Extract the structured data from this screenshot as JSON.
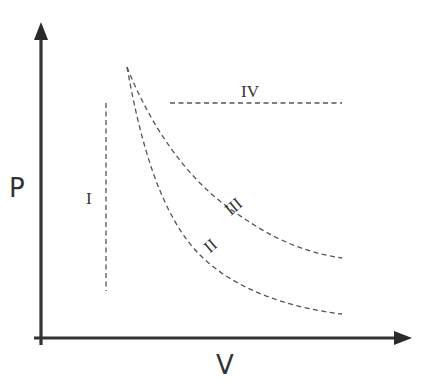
{
  "diagram": {
    "type": "pressure-volume process diagram",
    "axes": {
      "y_label": "P",
      "x_label": "V"
    },
    "processes": [
      {
        "id": "I",
        "label": "I",
        "shape": "vertical dashed line (constant volume)"
      },
      {
        "id": "II",
        "label": "II",
        "shape": "steeper descending dashed curve"
      },
      {
        "id": "III",
        "label": "III",
        "shape": "gentler descending dashed curve"
      },
      {
        "id": "IV",
        "label": "IV",
        "shape": "horizontal dashed line (constant pressure)"
      }
    ],
    "colors": {
      "axis": "#333333",
      "curve": "#555555",
      "background": "#ffffff"
    }
  }
}
